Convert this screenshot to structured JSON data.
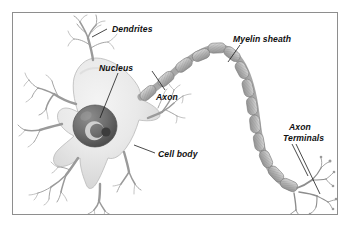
{
  "figure": {
    "frame_color": "#8e8e8e",
    "background_color": "#ffffff",
    "ink_color": "#111111",
    "cell_fill_color": "#e6e6e6",
    "myelin_color": "#b0b0b0",
    "nucleus_color": "#6f6f6f"
  },
  "labels": {
    "dendrites": "Dendrites",
    "nucleus": "Nucleus",
    "axon": "Axon",
    "myelin_sheath": "Myelin sheath",
    "cell_body": "Cell body",
    "axon_terminals_line1": "Axon",
    "axon_terminals_line2": "Terminals"
  },
  "parts": [
    {
      "id": "dendrites",
      "label": "Dendrites"
    },
    {
      "id": "nucleus",
      "label": "Nucleus"
    },
    {
      "id": "axon",
      "label": "Axon"
    },
    {
      "id": "myelin-sheath",
      "label": "Myelin sheath"
    },
    {
      "id": "cell-body",
      "label": "Cell body"
    },
    {
      "id": "axon-terminals",
      "label": "Axon Terminals"
    }
  ]
}
